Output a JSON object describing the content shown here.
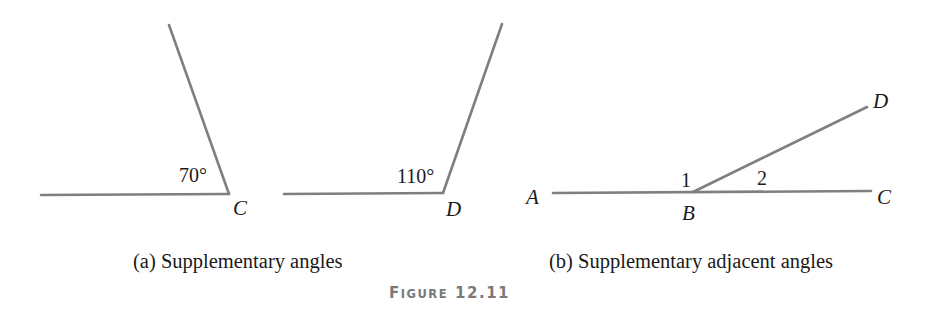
{
  "figure": {
    "number_prefix_first": "F",
    "number_prefix_rest": "IGURE",
    "number": "12.11",
    "line_color": "#7f7f7f",
    "text_color": "#1a1a1a",
    "caption_color": "#7a7a7a"
  },
  "panel_a": {
    "caption": "(a) Supplementary angles",
    "angle1": {
      "vertex_label": "C",
      "measure": "70°"
    },
    "angle2": {
      "vertex_label": "D",
      "measure": "110°"
    }
  },
  "panel_b": {
    "caption": "(b) Supplementary adjacent angles",
    "points": {
      "a": "A",
      "b": "B",
      "c": "C",
      "d": "D"
    },
    "angles": {
      "first": "1",
      "second": "2"
    }
  }
}
